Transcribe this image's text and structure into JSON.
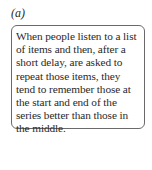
{
  "panel": {
    "label": "(a)",
    "text": "When people listen to a list of items and then, after a short delay, are asked to repeat those items, they tend to remember those at the start and end of the series better than those in the middle."
  }
}
